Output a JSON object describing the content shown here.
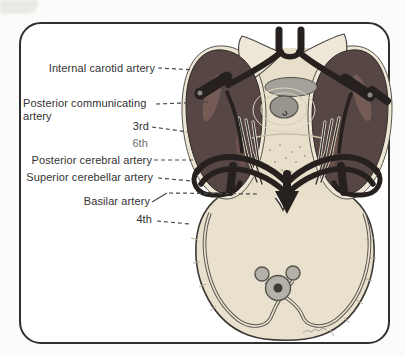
{
  "figure": {
    "labels": {
      "internal_carotid": "Internal carotid artery",
      "posterior_communicating": "Posterior communicating artery",
      "third_nerve": "3rd",
      "sixth_nerve": "6th",
      "posterior_cerebral": "Posterior cerebral artery",
      "superior_cerebellar": "Superior cerebellar artery",
      "basilar": "Basilar artery",
      "fourth_nerve": "4th"
    },
    "colors": {
      "artery_black": "#26211f",
      "temporal_lobe_maroon": "#564644",
      "lobe_highlight": "#755b56",
      "cortex_cream": "#eee6d4",
      "brainstem_tan": "#e7dfca",
      "cerebellum_tan": "#e9e1cd",
      "nuclei_gray": "#97958d",
      "outline": "#3c3936",
      "leader_line": "#4a4a4a",
      "label_text": "#333333",
      "frame_border": "#2f2f2f",
      "background": "#fbfbf9"
    }
  }
}
